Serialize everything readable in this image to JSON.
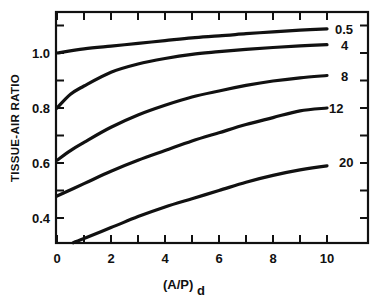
{
  "chart_data": {
    "type": "line",
    "title": "",
    "xlabel": "(A/P)",
    "xlabel_subscript": "d",
    "ylabel": "TISSUE-AIR RATIO",
    "xlim": [
      0,
      11.5
    ],
    "ylim": [
      0.31,
      1.15
    ],
    "grid": false,
    "legend_position": "inline labels at right end of curves",
    "x_ticks": [
      0,
      2,
      4,
      6,
      8,
      10
    ],
    "x_tick_labels": [
      "0",
      "2",
      "4",
      "6",
      "8",
      "10"
    ],
    "x_minor_ticks": [
      1,
      3,
      5,
      7,
      9
    ],
    "y_ticks": [
      0.4,
      0.6,
      0.8,
      1.0
    ],
    "y_tick_labels": [
      "0.4",
      "0.6",
      "0.8",
      "1.0"
    ],
    "y_minor_ticks": [
      0.5,
      0.7,
      0.9,
      1.1
    ],
    "series": [
      {
        "name": "0.5",
        "label": "0.5",
        "x": [
          0,
          1,
          2,
          3,
          4,
          5,
          6,
          7,
          8,
          9,
          10
        ],
        "values": [
          1.0,
          1.015,
          1.025,
          1.035,
          1.045,
          1.055,
          1.062,
          1.07,
          1.077,
          1.083,
          1.088
        ]
      },
      {
        "name": "4",
        "label": "4",
        "x": [
          0,
          0.5,
          1,
          2,
          3,
          4,
          5,
          6,
          7,
          8,
          9,
          10
        ],
        "values": [
          0.8,
          0.85,
          0.88,
          0.93,
          0.96,
          0.98,
          0.995,
          1.005,
          1.013,
          1.02,
          1.026,
          1.03
        ]
      },
      {
        "name": "8",
        "label": "8",
        "x": [
          0,
          0.5,
          1,
          2,
          3,
          4,
          5,
          6,
          7,
          8,
          9,
          10
        ],
        "values": [
          0.61,
          0.645,
          0.675,
          0.73,
          0.775,
          0.81,
          0.84,
          0.862,
          0.882,
          0.898,
          0.91,
          0.918
        ]
      },
      {
        "name": "12",
        "label": "12",
        "x": [
          0,
          1,
          2,
          3,
          4,
          5,
          6,
          7,
          8,
          9,
          10
        ],
        "values": [
          0.48,
          0.525,
          0.57,
          0.61,
          0.645,
          0.68,
          0.71,
          0.74,
          0.765,
          0.79,
          0.8
        ]
      },
      {
        "name": "20",
        "label": "20",
        "x": [
          0.6,
          1,
          2,
          3,
          4,
          5,
          6,
          7,
          8,
          9,
          10
        ],
        "values": [
          0.31,
          0.325,
          0.365,
          0.405,
          0.44,
          0.47,
          0.5,
          0.53,
          0.555,
          0.575,
          0.59
        ]
      }
    ]
  },
  "colors": {
    "line": "#111111",
    "background": "#ffffff"
  }
}
